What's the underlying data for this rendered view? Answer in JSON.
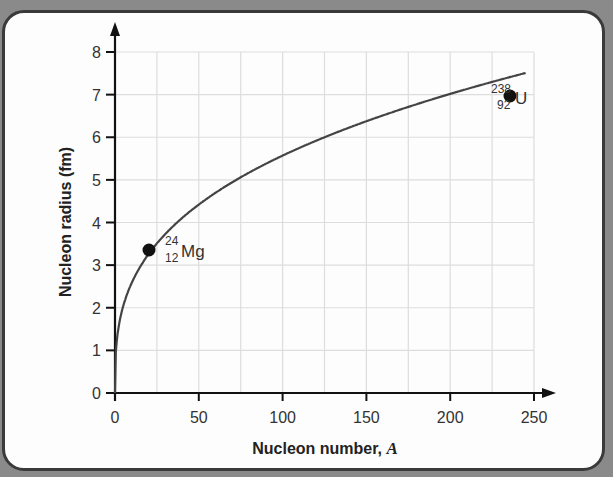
{
  "chart_data": {
    "type": "line",
    "title": "",
    "xlabel": "Nucleon number, A",
    "xlabel_prefix": "Nucleon number,",
    "xlabel_var": "A",
    "ylabel": "Nucleon radius (fm)",
    "xlim": [
      0,
      250
    ],
    "ylim": [
      0,
      8
    ],
    "grid": true,
    "legend": null,
    "x_ticks": [
      0,
      50,
      100,
      150,
      200,
      250
    ],
    "y_ticks": [
      0,
      1,
      2,
      3,
      4,
      5,
      6,
      7,
      8
    ],
    "series": [
      {
        "name": "r = r0 A^(1/3)",
        "x": [
          0,
          1,
          2,
          5,
          10,
          15,
          20,
          24,
          30,
          40,
          50,
          60,
          75,
          100,
          125,
          150,
          175,
          200,
          225,
          238,
          245
        ],
        "values": [
          0,
          1.2,
          1.51,
          2.05,
          2.59,
          2.96,
          3.26,
          3.46,
          3.73,
          4.1,
          4.42,
          4.7,
          5.06,
          5.57,
          6.0,
          6.37,
          6.71,
          7.02,
          7.3,
          7.44,
          7.51
        ]
      }
    ],
    "points": [
      {
        "label": "Mg",
        "mass_number": "24",
        "atomic_number": "12",
        "x": 24,
        "y": 3.35
      },
      {
        "label": "U",
        "mass_number": "238",
        "atomic_number": "92",
        "x": 238,
        "y": 7.6
      }
    ]
  },
  "labels": {
    "mg_mass": "24",
    "mg_atomic": "12",
    "mg_symbol": "Mg",
    "u_mass": "238",
    "u_atomic": "92",
    "u_symbol": "U",
    "x_title_text": "Nucleon number,",
    "x_title_var": "A",
    "y_title": "Nucleon radius (fm)"
  },
  "colors": {
    "curve": "#444444",
    "axis": "#111111",
    "grid": "#dddddd",
    "point": "#111111"
  }
}
